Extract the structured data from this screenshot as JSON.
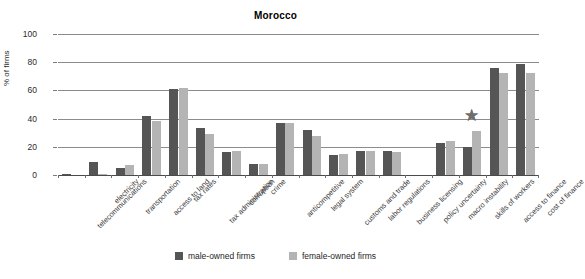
{
  "chart_data": {
    "type": "bar",
    "title": "Morocco",
    "xlabel": "",
    "ylabel": "% of firms",
    "ylim": [
      0,
      100
    ],
    "yticks": [
      0,
      20,
      40,
      60,
      80,
      100
    ],
    "grid": true,
    "legend_position": "bottom",
    "categories": [
      "telecommunications",
      "electricity",
      "transportation",
      "access to land",
      "tax rates",
      "tax administration",
      "corruption",
      "crime",
      "anticompetitive",
      "legal system",
      "customs and trade",
      "labor regulations",
      "business licensing",
      "policy uncertainty",
      "macro instability",
      "skills of workers",
      "access to finance",
      "cost of finance"
    ],
    "series": [
      {
        "name": "male-owned firms",
        "color": "#555555",
        "values": [
          1,
          9,
          5,
          42,
          61,
          33,
          16,
          8,
          37,
          32,
          14,
          17,
          17,
          0,
          23,
          20,
          76,
          79
        ]
      },
      {
        "name": "female-owned firms",
        "color": "#b4b4b4",
        "values": [
          0,
          1,
          7,
          38,
          62,
          29,
          17,
          8,
          37,
          28,
          15,
          17,
          16,
          0,
          24,
          31,
          72,
          72
        ]
      }
    ],
    "annotations": [
      {
        "name": "star-marker",
        "glyph": "★",
        "category": "skills of workers",
        "value": 42,
        "color": "#6e6e6e"
      }
    ]
  },
  "legend": {
    "items": [
      {
        "label": "male-owned firms",
        "color": "#555555"
      },
      {
        "label": "female-owned firms",
        "color": "#b4b4b4"
      }
    ]
  }
}
